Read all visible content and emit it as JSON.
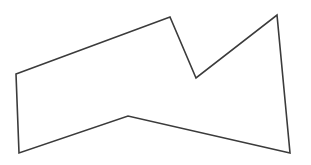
{
  "figure": {
    "name": "irregular-polygon",
    "type": "closed-polyline",
    "background_color": "#ffffff",
    "stroke_color": "#3b3b3b",
    "fill_color": "none",
    "stroke_width": 1.6,
    "vertex_count": 7,
    "viewbox": "0 0 311 165",
    "points_attr": "16,74 170,17 196,78 277,15 290,153 128,116 19,153",
    "vertices": [
      {
        "id": "v1",
        "name": "upper-left-corner",
        "x": 16,
        "y": 74
      },
      {
        "id": "v2",
        "name": "left-top-peak",
        "x": 170,
        "y": 17
      },
      {
        "id": "v3",
        "name": "notch-valley",
        "x": 196,
        "y": 78
      },
      {
        "id": "v4",
        "name": "right-top-peak",
        "x": 277,
        "y": 15
      },
      {
        "id": "v5",
        "name": "lower-right-corner",
        "x": 290,
        "y": 153
      },
      {
        "id": "v6",
        "name": "bottom-center-peak",
        "x": 128,
        "y": 116
      },
      {
        "id": "v7",
        "name": "lower-left-corner",
        "x": 19,
        "y": 153
      }
    ],
    "edges": [
      {
        "from": "v1",
        "to": "v2",
        "name": "upper-left-edge"
      },
      {
        "from": "v2",
        "to": "v3",
        "name": "notch-descending-edge"
      },
      {
        "from": "v3",
        "to": "v4",
        "name": "notch-ascending-edge"
      },
      {
        "from": "v4",
        "to": "v5",
        "name": "right-edge"
      },
      {
        "from": "v5",
        "to": "v6",
        "name": "lower-right-edge"
      },
      {
        "from": "v6",
        "to": "v7",
        "name": "lower-left-edge"
      },
      {
        "from": "v7",
        "to": "v1",
        "name": "left-edge"
      }
    ]
  },
  "canvas": {
    "width": 311,
    "height": 165
  }
}
